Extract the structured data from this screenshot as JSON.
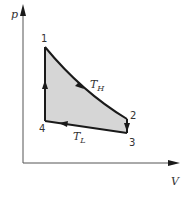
{
  "diagram": {
    "type": "pV-cycle",
    "axes": {
      "y_label": "p",
      "x_label": "V"
    },
    "points": [
      {
        "id": "1",
        "label": "1",
        "x": 45,
        "y": 47
      },
      {
        "id": "2",
        "label": "2",
        "x": 127,
        "y": 119
      },
      {
        "id": "3",
        "label": "3",
        "x": 127,
        "y": 133
      },
      {
        "id": "4",
        "label": "4",
        "x": 45,
        "y": 121
      }
    ],
    "processes": [
      {
        "from": "1",
        "to": "2",
        "label_main": "T",
        "label_sub": "H",
        "kind": "isotherm-high"
      },
      {
        "from": "2",
        "to": "3",
        "kind": "isochoric-cooling"
      },
      {
        "from": "3",
        "to": "4",
        "label_main": "T",
        "label_sub": "L",
        "kind": "isotherm-low"
      },
      {
        "from": "4",
        "to": "1",
        "kind": "isochoric-heating"
      }
    ],
    "colors": {
      "fill": "#d6d6d6",
      "line": "#1a1a1a",
      "axis": "#555555"
    }
  }
}
